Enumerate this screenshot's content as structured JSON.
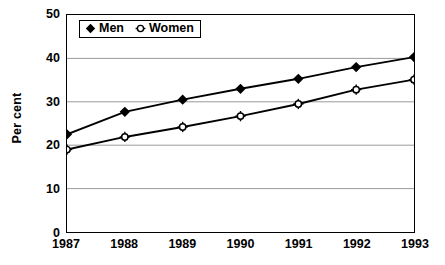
{
  "chart_data": {
    "type": "line",
    "title": "",
    "xlabel": "",
    "ylabel": "Per cent",
    "categories": [
      "1987",
      "1988",
      "1989",
      "1990",
      "1991",
      "1992",
      "1993"
    ],
    "x": [
      1987,
      1988,
      1989,
      1990,
      1991,
      1992,
      1993
    ],
    "series": [
      {
        "name": "Men",
        "marker": "filled-diamond",
        "color": "#000000",
        "values": [
          22.5,
          27.7,
          30.5,
          33.0,
          35.3,
          38.0,
          40.3
        ]
      },
      {
        "name": "Women",
        "marker": "open-circle-cross",
        "color": "#000000",
        "values": [
          19.0,
          21.9,
          24.2,
          26.7,
          29.5,
          32.8,
          35.1
        ]
      }
    ],
    "ylim": [
      0,
      50
    ],
    "y_ticks": [
      0,
      10,
      20,
      30,
      40,
      50
    ],
    "y_tick_labels": [
      "0",
      "10",
      "20",
      "30",
      "40",
      "50"
    ],
    "x_tick_labels": [
      "1987",
      "1988",
      "1989",
      "1990",
      "1991",
      "1992",
      "1993"
    ],
    "grid": "horizontal",
    "grid_color": "#999999",
    "legend_position": "top-left-inside",
    "legend_entries": [
      "Men",
      "Women"
    ],
    "plot_background": "#ffffff",
    "axis_color": "#000000"
  },
  "legend": {
    "men_label": "Men",
    "women_label": "Women"
  },
  "axes": {
    "y_title": "Per cent"
  }
}
